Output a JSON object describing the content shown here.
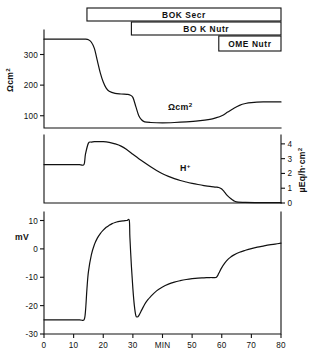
{
  "figure": {
    "title": "",
    "treatment_bars": [
      {
        "label": "BOK  Secr",
        "start_min": 14.5,
        "end_min": 80,
        "row": 0
      },
      {
        "label": "BO K  Nutr",
        "start_min": 29.5,
        "end_min": 80,
        "row": 1
      },
      {
        "label": "OME Nutr",
        "start_min": 59.0,
        "end_min": 80,
        "row": 2
      }
    ]
  },
  "chart_data": [
    {
      "type": "line",
      "panel": "resistance",
      "title": "",
      "xlabel": "MIN",
      "ylabel": "Ωcm²",
      "ylabel_parts": {
        "base": "Ωcm",
        "sup": "2"
      },
      "series_label": "Ωcm²",
      "series_label_parts": {
        "base": "Ωcm",
        "sup": "2"
      },
      "xlim": [
        0,
        80
      ],
      "ylim": [
        60,
        380
      ],
      "yticks": [
        100,
        200,
        300
      ],
      "ytick_labels": [
        "100",
        "200",
        "300"
      ],
      "grid": false,
      "legend": "none",
      "x": [
        0,
        4,
        8,
        12,
        14,
        15,
        16,
        17,
        18,
        19,
        20,
        21,
        22,
        24,
        26,
        28,
        29,
        30,
        31,
        32,
        33,
        34,
        36,
        40,
        44,
        48,
        52,
        56,
        58,
        60,
        62,
        64,
        66,
        68,
        70,
        74,
        78,
        80
      ],
      "y": [
        350,
        350,
        350,
        350,
        350,
        348,
        340,
        320,
        280,
        240,
        210,
        190,
        180,
        173,
        171,
        170,
        168,
        160,
        130,
        100,
        86,
        80,
        78,
        77,
        78,
        80,
        83,
        88,
        93,
        100,
        112,
        124,
        134,
        140,
        143,
        145,
        145,
        145
      ]
    },
    {
      "type": "line",
      "panel": "acid-secretion",
      "title": "",
      "xlabel": "MIN",
      "ylabel": "µEq/h·cm²",
      "ylabel_parts": {
        "base": "µEq/h·cm",
        "sup": "2"
      },
      "series_label": "H⁺",
      "series_label_parts": {
        "base": "H",
        "sup": "+"
      },
      "xlim": [
        0,
        80
      ],
      "ylim": [
        0,
        4.6
      ],
      "yticks": [
        0,
        1,
        2,
        3,
        4
      ],
      "ytick_labels": [
        "0",
        "1",
        "2",
        "3",
        "4"
      ],
      "yaxis_position": "right",
      "grid": false,
      "legend": "none",
      "x": [
        0,
        4,
        8,
        12,
        13.5,
        14,
        15,
        16,
        17,
        18,
        20,
        22,
        24,
        26,
        28,
        30,
        32,
        34,
        36,
        38,
        40,
        42,
        44,
        46,
        48,
        50,
        52,
        54,
        56,
        58,
        59,
        60,
        61,
        62,
        63,
        64,
        65,
        68,
        72,
        76,
        80
      ],
      "y": [
        2.6,
        2.6,
        2.6,
        2.6,
        2.6,
        3.3,
        4.05,
        4.12,
        4.15,
        4.15,
        4.15,
        4.1,
        4.0,
        3.85,
        3.6,
        3.3,
        3.0,
        2.72,
        2.45,
        2.2,
        1.98,
        1.8,
        1.65,
        1.52,
        1.42,
        1.33,
        1.25,
        1.18,
        1.12,
        1.08,
        1.05,
        0.95,
        0.72,
        0.48,
        0.3,
        0.16,
        0.08,
        0.04,
        0.03,
        0.03,
        0.03
      ]
    },
    {
      "type": "line",
      "panel": "potential-difference",
      "title": "",
      "xlabel": "MIN",
      "ylabel": "mV",
      "xlim": [
        0,
        80
      ],
      "ylim": [
        -30,
        13
      ],
      "yticks": [
        -30,
        -20,
        -10,
        0,
        10
      ],
      "ytick_labels": [
        "-30",
        "-20",
        "-10",
        "0",
        "10"
      ],
      "xticks": [
        0,
        10,
        20,
        30,
        40,
        50,
        60,
        70,
        80
      ],
      "xtick_labels": [
        "0",
        "10",
        "20",
        "30",
        "MIN",
        "50",
        "60",
        "70",
        "80"
      ],
      "grid": false,
      "legend": "none",
      "x": [
        0,
        4,
        8,
        12,
        13.5,
        14,
        14.5,
        15,
        16,
        17,
        18,
        19,
        20,
        21,
        22,
        23,
        24,
        25,
        26,
        27,
        28,
        28.8,
        29,
        29.5,
        30,
        30.5,
        31,
        31.5,
        32,
        33,
        34,
        35,
        36,
        38,
        40,
        42,
        44,
        46,
        48,
        50,
        52,
        54,
        56,
        57,
        58,
        58.5,
        59,
        60,
        61,
        62,
        63,
        64,
        66,
        68,
        70,
        72,
        74,
        76,
        78,
        80
      ],
      "y": [
        -25,
        -25,
        -25,
        -25,
        -25,
        -22,
        -14,
        -8,
        -2,
        1.5,
        3.8,
        5.4,
        6.6,
        7.6,
        8.3,
        8.9,
        9.3,
        9.6,
        9.8,
        9.9,
        10,
        10,
        4,
        -6,
        -14,
        -20,
        -23.5,
        -24,
        -23.5,
        -21.5,
        -19.5,
        -18,
        -16.8,
        -14.8,
        -13.4,
        -12.4,
        -11.7,
        -11.2,
        -10.8,
        -10.5,
        -10.3,
        -10.2,
        -10.1,
        -10.1,
        -10.1,
        -9.6,
        -8.6,
        -6.6,
        -5.0,
        -3.8,
        -2.9,
        -2.2,
        -1.2,
        -0.5,
        0.1,
        0.6,
        1.0,
        1.4,
        1.7,
        2.0
      ]
    }
  ]
}
